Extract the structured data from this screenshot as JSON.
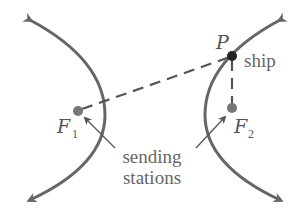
{
  "diagram": {
    "labels": {
      "point_P": "P",
      "ship": "ship",
      "focus1_main": "F",
      "focus1_sub": "1",
      "focus2_main": "F",
      "focus2_sub": "2",
      "callout_line1": "sending",
      "callout_line2": "stations"
    },
    "colors": {
      "curve": "#666666",
      "dot": "#777777",
      "ship_dot": "#222222",
      "text": "#555555"
    },
    "points": {
      "F1": [
        78,
        111
      ],
      "F2": [
        232,
        108
      ],
      "P": [
        232,
        56
      ]
    }
  }
}
